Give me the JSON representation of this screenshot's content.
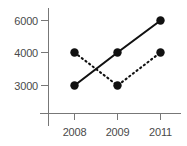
{
  "chart_data": {
    "type": "line",
    "title": "",
    "xlabel": "",
    "ylabel": "",
    "categories": [
      "2008",
      "2009",
      "2011"
    ],
    "x_tick_labels": [
      "2008",
      "2009",
      "2011"
    ],
    "y_tick_labels": [
      "3000",
      "4000",
      "6000"
    ],
    "y_tick_values": [
      3000,
      4000,
      6000
    ],
    "ylim": [
      3000,
      6000
    ],
    "grid": false,
    "legend_position": "none",
    "series": [
      {
        "name": "solid-series",
        "style": "solid",
        "marker": "filled-circle",
        "color": "#111111",
        "values": [
          3000,
          4000,
          6000
        ]
      },
      {
        "name": "dashed-series",
        "style": "dashed",
        "marker": "filled-circle",
        "color": "#111111",
        "values": [
          4000,
          3000,
          4000
        ]
      }
    ]
  },
  "axes": {
    "axis_color": "#777777",
    "label_color": "#4a4a4a"
  }
}
